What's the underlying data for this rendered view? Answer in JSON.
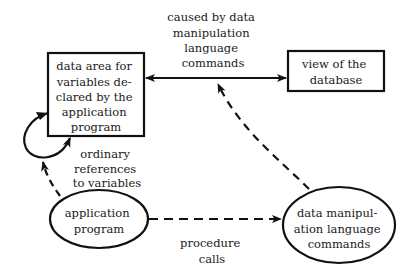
{
  "diagram": {
    "nodes": {
      "data_area": {
        "shape": "rectangle",
        "lines": [
          "data area for",
          "variables de-",
          "clared by the",
          "application",
          "program"
        ]
      },
      "db_view": {
        "shape": "rectangle",
        "lines": [
          "view of the",
          "database"
        ]
      },
      "app_program": {
        "shape": "ellipse",
        "lines": [
          "application",
          "program"
        ]
      },
      "dml_commands": {
        "shape": "ellipse",
        "lines": [
          "data manipul-",
          "ation language",
          "commands"
        ]
      }
    },
    "edge_labels": {
      "caused_by": [
        "caused by data",
        "manipulation",
        "language",
        "commands"
      ],
      "ordinary_refs": [
        "ordinary",
        "references",
        "to variables"
      ],
      "procedure_calls": [
        "procedure",
        "calls"
      ]
    },
    "edges": [
      {
        "from": "data_area",
        "to": "db_view",
        "style": "solid",
        "direction": "bidirectional",
        "label": "caused_by"
      },
      {
        "from": "dml_commands",
        "to": "caused_by-edge",
        "style": "dashed",
        "direction": "forward"
      },
      {
        "from": "app_program",
        "to": "dml_commands",
        "style": "dashed",
        "direction": "forward",
        "label": "procedure_calls"
      },
      {
        "from": "app_program",
        "to": "ordinary-refs-loop",
        "style": "dashed",
        "direction": "forward"
      },
      {
        "from": "data_area",
        "to": "data_area",
        "style": "solid",
        "direction": "loop",
        "label": "ordinary_refs"
      }
    ],
    "colors": {
      "stroke": "#111111",
      "background": "#ffffff"
    }
  }
}
